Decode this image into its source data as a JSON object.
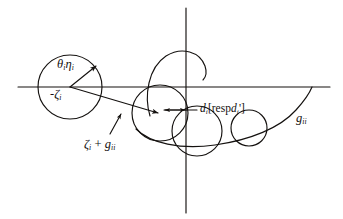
{
  "figure": {
    "background_color": "#ffffff",
    "stroke_color": "#14110f",
    "width": 343,
    "height": 219,
    "labels": {
      "theta_eta": "θ",
      "theta_eta_sub1": "i",
      "eta": "η",
      "eta_sub": "i",
      "neg_zeta": "-ζ",
      "neg_zeta_sub": "i",
      "zeta_plus_g": "ζ",
      "zeta_sub": "i",
      "plus": " + ",
      "g_italic": "g",
      "g_sub": "ii",
      "d_main": "d",
      "d_main_sub": "i",
      "bracket_open": "[",
      "resp": "resp",
      "d_prime": "d",
      "d_prime_sub": "i",
      "prime_mark": "'",
      "bracket_close": "]",
      "g_right": "g",
      "g_right_sub": "ii"
    },
    "axes": {
      "horizontal": {
        "y": 87,
        "x_start": 18,
        "x_end": 330
      },
      "vertical": {
        "x": 186,
        "y_start": 8,
        "y_end": 213
      }
    },
    "circles": [
      {
        "name": "left-main-circle",
        "cx": 70,
        "cy": 87,
        "r": 32
      },
      {
        "name": "middle-circle",
        "cx": 160,
        "cy": 113,
        "r": 28
      },
      {
        "name": "lower-center-circle",
        "cx": 197,
        "cy": 131,
        "r": 25
      },
      {
        "name": "lower-right-circle",
        "cx": 249,
        "cy": 128,
        "r": 18
      }
    ],
    "arcs": [
      {
        "name": "upper-spiral-arc",
        "description": "open arc above axis crossing imaginary axis"
      },
      {
        "name": "large-sweeping-arc",
        "description": "arc from lower left sweeping right up to real axis"
      }
    ],
    "arrows": [
      {
        "name": "radius-arrow",
        "from": [
          70,
          87
        ],
        "to": [
          95,
          66
        ]
      },
      {
        "name": "long-chord-arrow",
        "from": [
          70,
          87
        ],
        "to": [
          159,
          113
        ]
      },
      {
        "name": "d-measure-arrow-left",
        "from": [
          186,
          110
        ],
        "to": [
          163,
          110
        ]
      },
      {
        "name": "d-measure-arrow-right",
        "from": [
          163,
          110
        ],
        "to": [
          186,
          110
        ]
      },
      {
        "name": "leader-line-zeta",
        "from": [
          111,
          133
        ],
        "to": [
          121,
          116
        ]
      }
    ]
  }
}
